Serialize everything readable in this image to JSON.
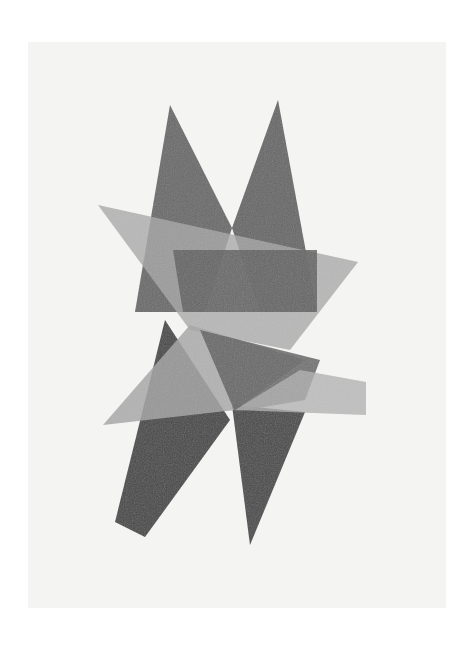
{
  "artwork": {
    "medium": "graphite drawing of overlapping geometric shapes",
    "colors": {
      "page_background": "#ffffff",
      "paper": "#f4f4f3",
      "dark_shape": "#4a4a4a",
      "mid_shape": "#6e6e6e",
      "light_shape": "#a8a8a8"
    }
  }
}
